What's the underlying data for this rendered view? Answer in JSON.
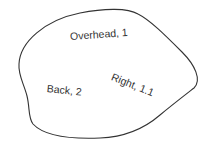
{
  "diagram": {
    "shape": {
      "type": "closed-blob",
      "stroke": "#333333",
      "fill": "#ffffff"
    },
    "labels": [
      {
        "id": "overhead",
        "text": "Overhead, 1",
        "x": 70,
        "y": 36,
        "rotate": -4
      },
      {
        "id": "right",
        "text": "Right, 1.1",
        "x": 111,
        "y": 75,
        "rotate": 22
      },
      {
        "id": "back",
        "text": "Back, 2",
        "x": 46,
        "y": 86,
        "rotate": 6
      }
    ]
  }
}
